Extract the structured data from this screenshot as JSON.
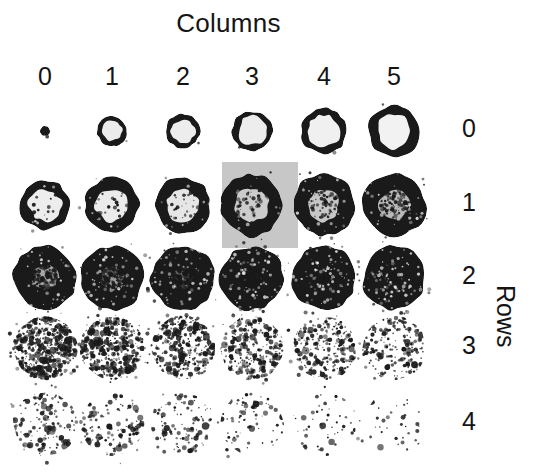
{
  "figure": {
    "columns_axis_title": "Columns",
    "rows_axis_title": "Rows",
    "column_labels": [
      "0",
      "1",
      "2",
      "3",
      "4",
      "5"
    ],
    "row_labels": [
      "0",
      "1",
      "2",
      "3",
      "4"
    ],
    "footnote": "",
    "background_color": "#ffffff",
    "highlight_color": "#c7c7c7",
    "blob_color": "#1a1a1a"
  },
  "chart_data": {
    "type": "heatmap",
    "title": "Columns",
    "xlabel": "Columns",
    "ylabel": "Rows",
    "x_tick_labels": [
      "0",
      "1",
      "2",
      "3",
      "4",
      "5"
    ],
    "y_tick_labels": [
      "0",
      "1",
      "2",
      "3",
      "4"
    ],
    "legend_position": "none",
    "grid": false,
    "axis_title_positions": {
      "columns": "top-center",
      "rows": "right-rotated"
    },
    "highlighted_cell": {
      "row": 1,
      "column": 3
    },
    "cell_centers_x": [
      45,
      112,
      183,
      252,
      324,
      394
    ],
    "cell_centers_y": [
      131,
      205,
      278,
      348,
      424
    ],
    "cells": [
      {
        "row": 0,
        "col": 0,
        "radius": 5,
        "ring": 1.0,
        "speckle": 0,
        "core": 0.0,
        "label": "tiny solid dot"
      },
      {
        "row": 0,
        "col": 1,
        "radius": 15,
        "ring": 0.34,
        "speckle": 0,
        "core": 0.92,
        "label": "small ring"
      },
      {
        "row": 0,
        "col": 2,
        "radius": 17,
        "ring": 0.3,
        "speckle": 0,
        "core": 0.93,
        "label": "ring"
      },
      {
        "row": 0,
        "col": 3,
        "radius": 20,
        "ring": 0.28,
        "speckle": 0,
        "core": 0.93,
        "label": "ring"
      },
      {
        "row": 0,
        "col": 4,
        "radius": 23,
        "ring": 0.3,
        "speckle": 0,
        "core": 0.94,
        "label": "ring"
      },
      {
        "row": 0,
        "col": 5,
        "radius": 26,
        "ring": 0.34,
        "speckle": 0,
        "core": 0.95,
        "label": "thick ring"
      },
      {
        "row": 1,
        "col": 0,
        "radius": 25,
        "ring": 0.36,
        "speckle": 0.04,
        "core": 0.93,
        "label": "blob bright core"
      },
      {
        "row": 1,
        "col": 1,
        "radius": 27,
        "ring": 0.38,
        "speckle": 0.06,
        "core": 0.92,
        "label": "blob bright core"
      },
      {
        "row": 1,
        "col": 2,
        "radius": 28,
        "ring": 0.4,
        "speckle": 0.08,
        "core": 0.9,
        "label": "blob bright core"
      },
      {
        "row": 1,
        "col": 3,
        "radius": 31,
        "ring": 0.46,
        "speckle": 0.1,
        "core": 0.8,
        "label": "blob highlighted"
      },
      {
        "row": 1,
        "col": 4,
        "radius": 31,
        "ring": 0.48,
        "speckle": 0.16,
        "core": 0.78,
        "label": "blob darker"
      },
      {
        "row": 1,
        "col": 5,
        "radius": 32,
        "ring": 0.52,
        "speckle": 0.22,
        "core": 0.72,
        "label": "blob darker"
      },
      {
        "row": 2,
        "col": 0,
        "radius": 32,
        "ring": 0.6,
        "speckle": 0.3,
        "core": 0.66,
        "label": "noisy blob"
      },
      {
        "row": 2,
        "col": 1,
        "radius": 32,
        "ring": 0.62,
        "speckle": 0.38,
        "core": 0.6,
        "label": "noisy blob"
      },
      {
        "row": 2,
        "col": 2,
        "radius": 32,
        "ring": 0.66,
        "speckle": 0.48,
        "core": 0.5,
        "label": "noisy blob"
      },
      {
        "row": 2,
        "col": 3,
        "radius": 32,
        "ring": 0.72,
        "speckle": 0.58,
        "core": 0.4,
        "label": "noisy dark blob"
      },
      {
        "row": 2,
        "col": 4,
        "radius": 32,
        "ring": 0.78,
        "speckle": 0.66,
        "core": 0.3,
        "label": "noisy dark blob"
      },
      {
        "row": 2,
        "col": 5,
        "radius": 32,
        "ring": 0.84,
        "speckle": 0.74,
        "core": 0.55,
        "label": "fragmented blob"
      },
      {
        "row": 3,
        "col": 0,
        "radius": 32,
        "ring": 0.0,
        "speckle": 0.92,
        "core": 0.0,
        "label": "dense speckle"
      },
      {
        "row": 3,
        "col": 1,
        "radius": 32,
        "ring": 0.0,
        "speckle": 0.74,
        "core": 0.0,
        "label": "speckle"
      },
      {
        "row": 3,
        "col": 2,
        "radius": 32,
        "ring": 0.0,
        "speckle": 0.58,
        "core": 0.0,
        "label": "speckle"
      },
      {
        "row": 3,
        "col": 3,
        "radius": 32,
        "ring": 0.0,
        "speckle": 0.48,
        "core": 0.0,
        "label": "speckle"
      },
      {
        "row": 3,
        "col": 4,
        "radius": 32,
        "ring": 0.0,
        "speckle": 0.42,
        "core": 0.0,
        "label": "speckle"
      },
      {
        "row": 3,
        "col": 5,
        "radius": 32,
        "ring": 0.0,
        "speckle": 0.36,
        "core": 0.0,
        "label": "sparse speckle"
      },
      {
        "row": 4,
        "col": 0,
        "radius": 32,
        "ring": 0.0,
        "speckle": 0.26,
        "core": 0.0,
        "label": "sparse speckle"
      },
      {
        "row": 4,
        "col": 1,
        "radius": 32,
        "ring": 0.0,
        "speckle": 0.22,
        "core": 0.0,
        "label": "sparse speckle"
      },
      {
        "row": 4,
        "col": 2,
        "radius": 32,
        "ring": 0.0,
        "speckle": 0.18,
        "core": 0.0,
        "label": "sparse speckle"
      },
      {
        "row": 4,
        "col": 3,
        "radius": 32,
        "ring": 0.0,
        "speckle": 0.13,
        "core": 0.0,
        "label": "very sparse speckle"
      },
      {
        "row": 4,
        "col": 4,
        "radius": 32,
        "ring": 0.0,
        "speckle": 0.09,
        "core": 0.0,
        "label": "very sparse speckle"
      },
      {
        "row": 4,
        "col": 5,
        "radius": 32,
        "ring": 0.0,
        "speckle": 0.06,
        "core": 0.0,
        "label": "very sparse speckle"
      }
    ]
  }
}
